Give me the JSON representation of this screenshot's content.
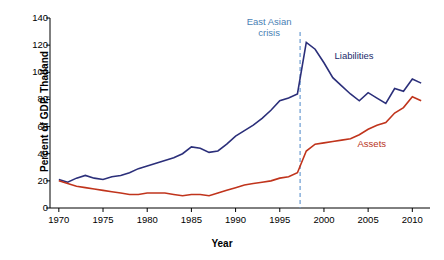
{
  "chart_data": {
    "type": "line",
    "title": "",
    "xlabel": "Year",
    "ylabel": "Percent of GDP, Thailand",
    "xlim": [
      1969,
      2012
    ],
    "ylim": [
      0,
      140
    ],
    "yticks": [
      0,
      20,
      40,
      60,
      80,
      100,
      120,
      140
    ],
    "xticks": [
      1970,
      1975,
      1980,
      1985,
      1990,
      1995,
      2000,
      2005,
      2010
    ],
    "grid": false,
    "legend": "inline-labels",
    "annotations": [
      {
        "text": "East Asian crisis",
        "line1": "East Asian",
        "line2": "crisis",
        "x": 1997.3,
        "color": "#4a7fb5",
        "style": "dashed-vertical-line"
      }
    ],
    "x": [
      1970,
      1971,
      1972,
      1973,
      1974,
      1975,
      1976,
      1977,
      1978,
      1979,
      1980,
      1981,
      1982,
      1983,
      1984,
      1985,
      1986,
      1987,
      1988,
      1989,
      1990,
      1991,
      1992,
      1993,
      1994,
      1995,
      1996,
      1997,
      1998,
      1999,
      2000,
      2001,
      2002,
      2003,
      2004,
      2005,
      2006,
      2007,
      2008,
      2009,
      2010,
      2011
    ],
    "series": [
      {
        "name": "Liabilities",
        "color": "#2b2f7a",
        "label_x": 2001.2,
        "label_y": 112,
        "values": [
          21,
          19,
          22,
          24,
          22,
          21,
          23,
          24,
          26,
          29,
          31,
          33,
          35,
          37,
          40,
          45,
          44,
          41,
          42,
          47,
          53,
          57,
          61,
          66,
          72,
          79,
          81,
          84,
          122,
          117,
          107,
          96,
          90,
          84,
          79,
          85,
          81,
          77,
          88,
          86,
          95,
          92
        ]
      },
      {
        "name": "Assets",
        "color": "#c0341c",
        "label_x": 2003.8,
        "label_y": 47,
        "values": [
          20,
          18,
          16,
          15,
          14,
          13,
          12,
          11,
          10,
          10,
          11,
          11,
          11,
          10,
          9,
          10,
          10,
          9,
          11,
          13,
          15,
          17,
          18,
          19,
          20,
          22,
          23,
          26,
          42,
          47,
          48,
          49,
          50,
          51,
          54,
          58,
          61,
          63,
          70,
          74,
          82,
          79
        ]
      }
    ]
  }
}
